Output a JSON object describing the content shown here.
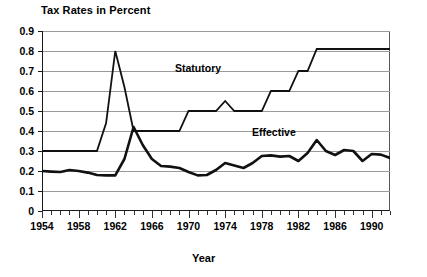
{
  "chart_data": {
    "type": "line",
    "title": "Tax Rates in Percent",
    "xlabel": "Year",
    "ylabel": "",
    "xlim": [
      1954,
      1992
    ],
    "ylim": [
      0,
      0.9
    ],
    "grid": true,
    "legend_position": "inline-annotations",
    "ytick_labels": [
      "0.9",
      "0.8",
      "0.7",
      "0.6",
      "0.5",
      "0.4",
      "0.3",
      "0.2",
      "0.1",
      "0"
    ],
    "ytick_values": [
      0.9,
      0.8,
      0.7,
      0.6,
      0.5,
      0.4,
      0.3,
      0.2,
      0.1,
      0
    ],
    "xtick_labels": [
      "1954",
      "1958",
      "1962",
      "1966",
      "1970",
      "1974",
      "1978",
      "1982",
      "1986",
      "1990"
    ],
    "xtick_values": [
      1954,
      1958,
      1962,
      1966,
      1970,
      1974,
      1978,
      1982,
      1986,
      1990
    ],
    "xtick_minor_step": 1,
    "x": [
      1954,
      1955,
      1956,
      1957,
      1958,
      1959,
      1960,
      1961,
      1962,
      1963,
      1964,
      1965,
      1966,
      1967,
      1968,
      1969,
      1970,
      1971,
      1972,
      1973,
      1974,
      1975,
      1976,
      1977,
      1978,
      1979,
      1980,
      1981,
      1982,
      1983,
      1984,
      1985,
      1986,
      1987,
      1988,
      1989,
      1990,
      1991,
      1992
    ],
    "series": [
      {
        "name": "Statutory",
        "values": [
          0.3,
          0.3,
          0.3,
          0.3,
          0.3,
          0.3,
          0.3,
          0.44,
          0.8,
          0.62,
          0.4,
          0.4,
          0.4,
          0.4,
          0.4,
          0.4,
          0.5,
          0.5,
          0.5,
          0.5,
          0.55,
          0.5,
          0.5,
          0.5,
          0.5,
          0.6,
          0.6,
          0.6,
          0.7,
          0.7,
          0.81,
          0.81,
          0.81,
          0.81,
          0.81,
          0.81,
          0.81,
          0.81,
          0.81
        ]
      },
      {
        "name": "Effective",
        "values": [
          0.2,
          0.197,
          0.195,
          0.205,
          0.2,
          0.192,
          0.18,
          0.178,
          0.178,
          0.26,
          0.42,
          0.33,
          0.26,
          0.225,
          0.222,
          0.215,
          0.195,
          0.178,
          0.18,
          0.205,
          0.24,
          0.228,
          0.215,
          0.24,
          0.275,
          0.278,
          0.272,
          0.275,
          0.25,
          0.29,
          0.355,
          0.3,
          0.28,
          0.305,
          0.3,
          0.25,
          0.285,
          0.282,
          0.265
        ]
      }
    ],
    "annotations": [
      {
        "text": "Statutory",
        "series": "Statutory"
      },
      {
        "text": "Effective",
        "series": "Effective"
      }
    ]
  }
}
